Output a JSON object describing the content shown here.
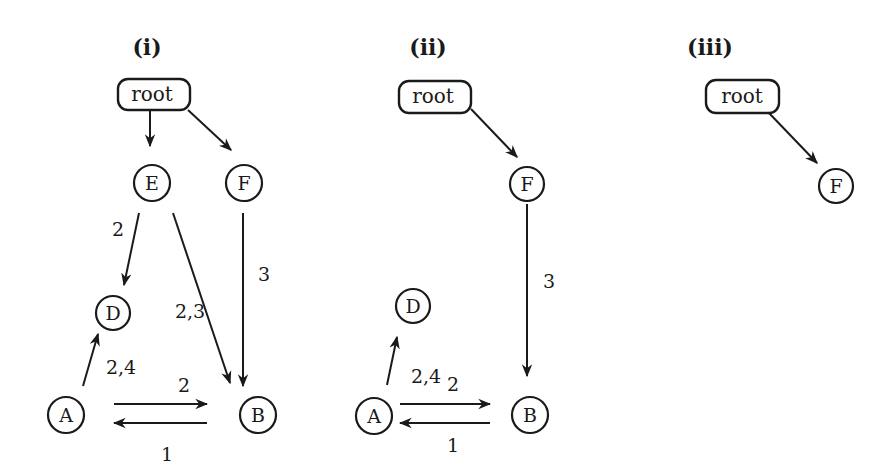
{
  "figure": {
    "background_color": "#ffffff",
    "ink_color": "#1a1a1a",
    "panels": [
      {
        "label": "(i)",
        "root": {
          "label": "root"
        },
        "nodes": [
          {
            "id": "E",
            "label": "E"
          },
          {
            "id": "F",
            "label": "F"
          },
          {
            "id": "D",
            "label": "D"
          },
          {
            "id": "A",
            "label": "A"
          },
          {
            "id": "B",
            "label": "B"
          }
        ],
        "edges": [
          {
            "from": "root",
            "to": "E",
            "label": ""
          },
          {
            "from": "root",
            "to": "F",
            "label": ""
          },
          {
            "from": "E",
            "to": "D",
            "label": "2"
          },
          {
            "from": "E",
            "to": "B",
            "label": "2,3"
          },
          {
            "from": "F",
            "to": "B",
            "label": "3"
          },
          {
            "from": "A",
            "to": "D",
            "label": "2,4"
          },
          {
            "from": "A",
            "to": "B",
            "label": "2"
          },
          {
            "from": "B",
            "to": "A",
            "label": "1"
          }
        ]
      },
      {
        "label": "(ii)",
        "root": {
          "label": "root"
        },
        "nodes": [
          {
            "id": "F",
            "label": "F"
          },
          {
            "id": "D",
            "label": "D"
          },
          {
            "id": "A",
            "label": "A"
          },
          {
            "id": "B",
            "label": "B"
          }
        ],
        "edges": [
          {
            "from": "root",
            "to": "F",
            "label": ""
          },
          {
            "from": "F",
            "to": "B",
            "label": "3"
          },
          {
            "from": "A",
            "to": "D",
            "label": "2,4"
          },
          {
            "from": "A",
            "to": "B",
            "label": "2"
          },
          {
            "from": "B",
            "to": "A",
            "label": "1"
          }
        ]
      },
      {
        "label": "(iii)",
        "root": {
          "label": "root"
        },
        "nodes": [
          {
            "id": "F",
            "label": "F"
          }
        ],
        "edges": [
          {
            "from": "root",
            "to": "F",
            "label": ""
          }
        ]
      }
    ]
  }
}
